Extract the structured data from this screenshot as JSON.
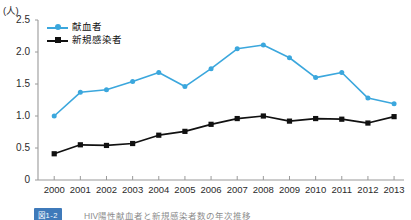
{
  "chart_data": {
    "type": "line",
    "title": "",
    "unit_label": "(人)",
    "xlabel": "",
    "ylabel": "",
    "ylim": [
      0,
      2.5
    ],
    "yticks": [
      "0",
      "0.5",
      "1.0",
      "1.5",
      "2.0",
      "2.5"
    ],
    "ytick_values": [
      0,
      0.5,
      1.0,
      1.5,
      2.0,
      2.5
    ],
    "grid": false,
    "legend_position": "top-left",
    "categories": [
      "2000",
      "2001",
      "2002",
      "2003",
      "2004",
      "2005",
      "2006",
      "2007",
      "2008",
      "2009",
      "2010",
      "2011",
      "2012",
      "2013"
    ],
    "series": [
      {
        "name": "献血者",
        "color": "#3ba7dd",
        "marker": "circle",
        "values": [
          1.0,
          1.37,
          1.41,
          1.54,
          1.68,
          1.46,
          1.74,
          2.05,
          2.11,
          1.91,
          1.6,
          1.68,
          1.28,
          1.19
        ]
      },
      {
        "name": "新規感染者",
        "color": "#111111",
        "marker": "square",
        "values": [
          0.41,
          0.55,
          0.54,
          0.57,
          0.7,
          0.76,
          0.87,
          0.96,
          1.0,
          0.92,
          0.96,
          0.95,
          0.89,
          0.99
        ]
      }
    ]
  },
  "caption": {
    "tag": "図1-2",
    "text": "HIV陽性献血者と新規感染者数の年次推移"
  }
}
